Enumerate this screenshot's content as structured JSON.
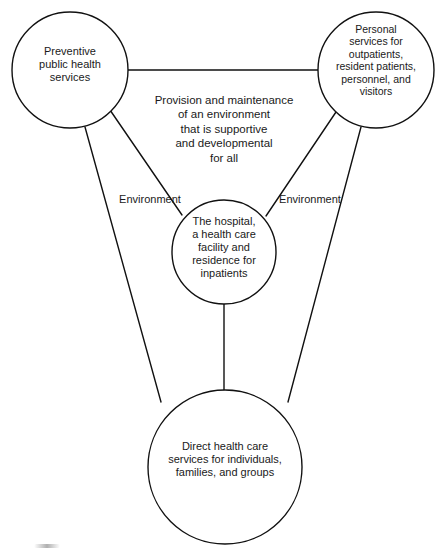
{
  "diagram": {
    "background_color": "#ffffff",
    "stroke_color": "#111111",
    "text_color": "#1a1a1a",
    "nodes": [
      {
        "id": "preventive",
        "label": "Preventive\npublic health\nservices",
        "cx": 70,
        "cy": 70,
        "r": 58
      },
      {
        "id": "personal",
        "label": "Personal\nservices for\noutpatients,\nresident patients,\npersonnel, and\nvisitors",
        "cx": 376,
        "cy": 70,
        "r": 58
      },
      {
        "id": "hospital",
        "label": "The hospital,\na health care\nfacility and\nresidence for\ninpatients",
        "cx": 224,
        "cy": 252,
        "r": 52
      },
      {
        "id": "direct",
        "label": "Direct health care\nservices for individuals,\nfamilies, and groups",
        "cx": 225,
        "cy": 467,
        "r": 77
      }
    ],
    "edges": [
      {
        "id": "preventive-personal",
        "from": "preventive",
        "to": "personal",
        "x1": 128,
        "y1": 70,
        "x2": 318,
        "y2": 70
      },
      {
        "id": "preventive-hospital",
        "from": "preventive",
        "to": "hospital",
        "x1": 110,
        "y1": 110,
        "x2": 182,
        "y2": 215
      },
      {
        "id": "personal-hospital",
        "from": "personal",
        "to": "hospital",
        "x1": 336,
        "y1": 112,
        "x2": 266,
        "y2": 216
      },
      {
        "id": "preventive-direct",
        "from": "preventive",
        "to": "direct",
        "x1": 85,
        "y1": 127,
        "x2": 161,
        "y2": 402
      },
      {
        "id": "personal-direct",
        "from": "personal",
        "to": "direct",
        "x1": 361,
        "y1": 127,
        "x2": 288,
        "y2": 402
      },
      {
        "id": "hospital-direct",
        "from": "hospital",
        "to": "direct",
        "x1": 224,
        "y1": 304,
        "x2": 224,
        "y2": 391
      }
    ],
    "edge_labels": [
      {
        "id": "environment-left",
        "text": "Environment",
        "x": 110,
        "y": 193
      },
      {
        "id": "environment-right",
        "text": "Environment",
        "x": 270,
        "y": 193
      }
    ],
    "free_labels": [
      {
        "id": "environment-statement",
        "text": "Provision and maintenance\nof an environment\nthat is supportive\nand developmental\nfor all",
        "x": 145,
        "y": 93,
        "width": 158
      }
    ]
  }
}
